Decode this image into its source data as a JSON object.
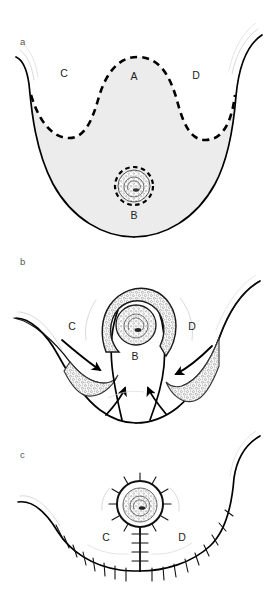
{
  "figure": {
    "background_color": "#ffffff",
    "line_color": "#000000",
    "fill_color": "#ececec",
    "width": 276,
    "height": 589
  },
  "panels": [
    {
      "id": "a",
      "letter": "a",
      "description": "Preoperative markings: de-epithelialization area outlined with dashed lines",
      "letter_pos": {
        "x": 20,
        "y": 45
      },
      "labels": [
        {
          "text": "C",
          "x": 64,
          "y": 77
        },
        {
          "text": "A",
          "x": 134,
          "y": 80
        },
        {
          "text": "D",
          "x": 196,
          "y": 79
        },
        {
          "text": "B",
          "x": 134,
          "y": 219
        }
      ],
      "nipple": {
        "cx": 134,
        "cy": 186,
        "r_areola": 19,
        "r_nipple": 11,
        "dashed": true
      }
    },
    {
      "id": "b",
      "letter": "b",
      "description": "Flaps elevated and transposed; arrows indicate direction of advancement",
      "letter_pos": {
        "x": 20,
        "y": 265
      },
      "labels": [
        {
          "text": "C",
          "x": 72,
          "y": 330
        },
        {
          "text": "B",
          "x": 135,
          "y": 360
        },
        {
          "text": "D",
          "x": 192,
          "y": 330
        }
      ],
      "nipple": {
        "cx": 136,
        "cy": 325,
        "r_areola": 20,
        "r_nipple": 12,
        "dashed": false
      },
      "arrow_count": 4
    },
    {
      "id": "c",
      "letter": "c",
      "description": "Final closure with inverted-T suture line and repositioned nipple-areola complex",
      "letter_pos": {
        "x": 20,
        "y": 458
      },
      "labels": [
        {
          "text": "C",
          "x": 106,
          "y": 541
        },
        {
          "text": "D",
          "x": 182,
          "y": 541
        }
      ],
      "nipple": {
        "cx": 140,
        "cy": 504,
        "r_areola": 23,
        "r_nipple": 15,
        "sutured": true
      }
    }
  ],
  "legend": {
    "A": "Upper de-epithelialized pedicle segment",
    "B": "Lower breast segment",
    "C": "Medial flap",
    "D": "Lateral flap"
  }
}
